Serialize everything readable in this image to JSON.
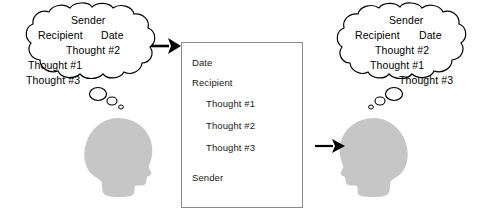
{
  "diagram": {
    "left_bubble": {
      "name": "sender-thoughts-unordered",
      "lines": [
        {
          "text": "Sender",
          "x": 71,
          "y": 14
        },
        {
          "text": "Recipient",
          "x": 38,
          "y": 29
        },
        {
          "text": "Date",
          "x": 101,
          "y": 29
        },
        {
          "text": "Thought #2",
          "x": 66,
          "y": 44
        },
        {
          "text": "Thought #1",
          "x": 28,
          "y": 59
        },
        {
          "text": "Thought #3",
          "x": 26,
          "y": 74
        }
      ]
    },
    "document": {
      "name": "written-document",
      "lines": [
        {
          "text": "Date",
          "x": 192,
          "y": 57
        },
        {
          "text": "Recipient",
          "x": 192,
          "y": 77
        },
        {
          "text": "Thought #1",
          "x": 206,
          "y": 98
        },
        {
          "text": "Thought #2",
          "x": 206,
          "y": 120
        },
        {
          "text": "Thought #3",
          "x": 206,
          "y": 142
        },
        {
          "text": "Sender",
          "x": 192,
          "y": 172
        }
      ]
    },
    "right_bubble": {
      "name": "recipient-thoughts-reconstructed",
      "lines": [
        {
          "text": "Sender",
          "x": 389,
          "y": 14
        },
        {
          "text": "Recipient",
          "x": 355,
          "y": 29
        },
        {
          "text": "Date",
          "x": 419,
          "y": 29
        },
        {
          "text": "Thought #2",
          "x": 375,
          "y": 44
        },
        {
          "text": "Thought #1",
          "x": 370,
          "y": 59
        },
        {
          "text": "Thought #3",
          "x": 399,
          "y": 74
        }
      ]
    },
    "arrows": [
      {
        "name": "arrow-thoughts-to-document",
        "label": ""
      },
      {
        "name": "arrow-document-to-recipient",
        "label": ""
      }
    ],
    "figures": [
      {
        "name": "sender-head-silhouette",
        "facing": "right"
      },
      {
        "name": "recipient-head-silhouette",
        "facing": "left"
      }
    ],
    "colors": {
      "head_fill": "#c6c6c6",
      "outline": "#000000",
      "document_border": "#8b8b8b",
      "text": "#1a1a1a",
      "background": "#ffffff"
    }
  }
}
